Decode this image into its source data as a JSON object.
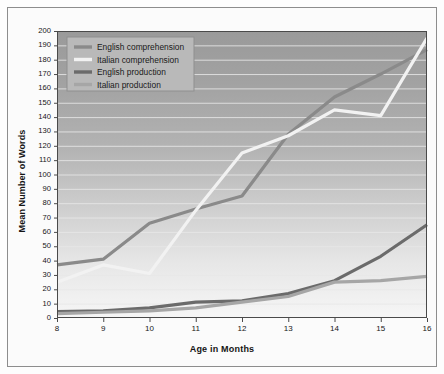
{
  "chart_data": {
    "type": "line",
    "title": "",
    "xlabel": "Age in Months",
    "ylabel": "Mean Number of Words",
    "x": [
      8,
      9,
      10,
      11,
      12,
      13,
      14,
      15,
      16
    ],
    "xtick_labels": [
      "8",
      "9",
      "10",
      "11",
      "12",
      "13",
      "14",
      "15",
      "16"
    ],
    "xlim": [
      8,
      16
    ],
    "ylim": [
      0,
      200
    ],
    "ytick_labels": [
      "0",
      "10",
      "20",
      "30",
      "40",
      "50",
      "60",
      "70",
      "80",
      "90",
      "100",
      "110",
      "120",
      "130",
      "140",
      "150",
      "160",
      "170",
      "180",
      "190",
      "200"
    ],
    "ytick_values": [
      0,
      10,
      20,
      30,
      40,
      50,
      60,
      70,
      80,
      90,
      100,
      110,
      120,
      130,
      140,
      150,
      160,
      170,
      180,
      190,
      200
    ],
    "grid": "horizontal",
    "legend_position": "top-left",
    "series": [
      {
        "name": "English comprehension",
        "color": "#8a8a8a",
        "width": 3.2,
        "values": [
          37,
          41,
          66,
          76,
          85,
          128,
          154,
          170,
          187
        ]
      },
      {
        "name": "Italian comprehension",
        "color": "#f2f2f2",
        "width": 3.2,
        "values": [
          25,
          37,
          31,
          75,
          115,
          127,
          145,
          141,
          195
        ]
      },
      {
        "name": "English production",
        "color": "#6b6b6b",
        "width": 3.2,
        "values": [
          4.5,
          5,
          7,
          11,
          12,
          17,
          26,
          43,
          65
        ]
      },
      {
        "name": "Italian production",
        "color": "#a6a6a6",
        "width": 3.2,
        "values": [
          3,
          4,
          5,
          7,
          11,
          15,
          25,
          26,
          29
        ]
      }
    ]
  },
  "legend": {
    "items": [
      {
        "label": "English comprehension",
        "color": "#8a8a8a"
      },
      {
        "label": "Italian comprehension",
        "color": "#f2f2f2"
      },
      {
        "label": "English production",
        "color": "#6b6b6b"
      },
      {
        "label": "Italian production",
        "color": "#a6a6a6"
      }
    ]
  },
  "style": {
    "plot_bg_top": "#9a9a9a",
    "plot_bg_bottom": "#f4f4f4",
    "gridline_color": "#e8e8e8",
    "axis_color": "#4a4a4a",
    "legend_bg": "#b9b9b9",
    "legend_border": "#8f8f8f",
    "frame_border": "#8d8d8d"
  }
}
